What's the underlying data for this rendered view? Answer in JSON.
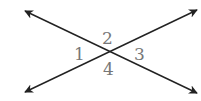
{
  "diagram": {
    "type": "intersecting-lines",
    "intersection": {
      "x": 110,
      "y": 52
    },
    "lines": [
      {
        "name": "line-a",
        "from": {
          "x": 25,
          "y": 11
        },
        "to": {
          "x": 197,
          "y": 93
        },
        "arrows": "both"
      },
      {
        "name": "line-b",
        "from": {
          "x": 25,
          "y": 92
        },
        "to": {
          "x": 197,
          "y": 10
        },
        "arrows": "both"
      }
    ],
    "colors": {
      "line": "#222222",
      "label": "#777777",
      "background": "#ffffff"
    },
    "angle_labels": [
      {
        "id": "1",
        "text": "1",
        "x": 74,
        "y": 46
      },
      {
        "id": "2",
        "text": "2",
        "x": 102,
        "y": 30
      },
      {
        "id": "3",
        "text": "3",
        "x": 134,
        "y": 46
      },
      {
        "id": "4",
        "text": "4",
        "x": 103,
        "y": 61
      }
    ]
  }
}
